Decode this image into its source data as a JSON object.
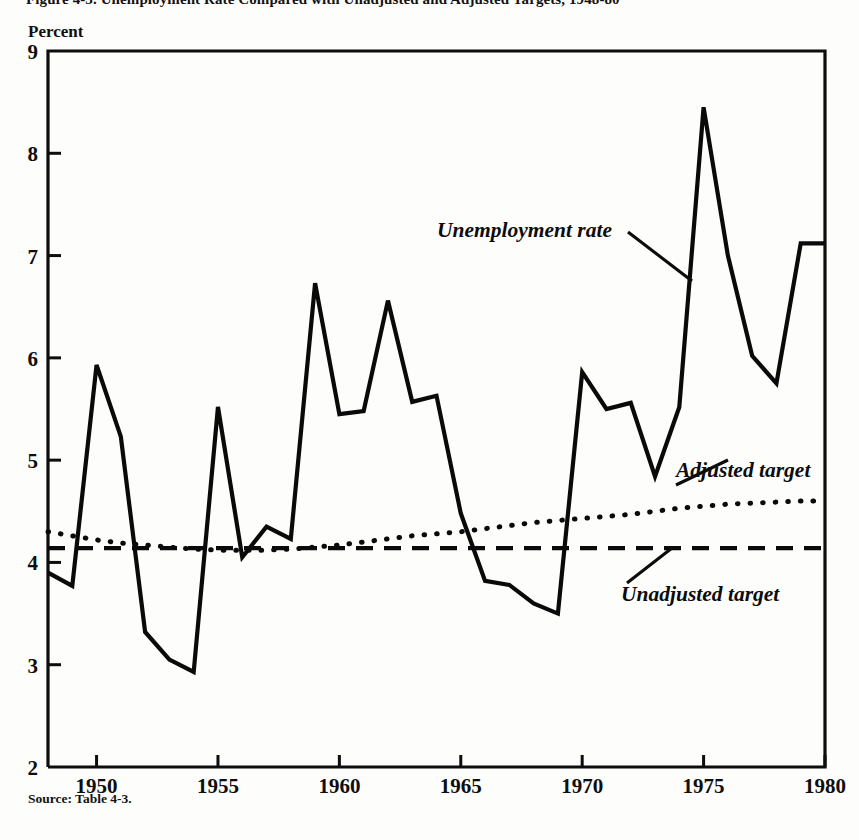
{
  "figure": {
    "clipped_title": "Figure 4-3.  Unemployment Rate Compared with Unadjusted and Adjusted Targets, 1948-80",
    "y_axis_unit": "Percent",
    "source": "Source:  Table 4-3."
  },
  "annotations": {
    "series_label": "Unemployment rate",
    "adjusted_label": "Adjusted target",
    "unadjusted_label": "Unadjusted target"
  },
  "chart_data": {
    "type": "line",
    "title": "Unemployment Rate Compared with Unadjusted and Adjusted Targets, 1948-80",
    "xlabel": "",
    "ylabel": "Percent",
    "xlim": [
      1948,
      1980
    ],
    "ylim": [
      2,
      9
    ],
    "ytick_labels": [
      "9",
      "8",
      "7",
      "6",
      "5",
      "4",
      "3",
      "2"
    ],
    "yticks": [
      9,
      8,
      7,
      6,
      5,
      4,
      3,
      2
    ],
    "xtick_labels": [
      "1950",
      "1955",
      "1960",
      "1965",
      "1970",
      "1975",
      "1980"
    ],
    "xticks": [
      1950,
      1955,
      1960,
      1965,
      1970,
      1975,
      1980
    ],
    "grid": false,
    "legend_position": "inline-annotations",
    "x": [
      1948,
      1949,
      1950,
      1951,
      1952,
      1953,
      1954,
      1955,
      1956,
      1957,
      1958,
      1959,
      1960,
      1961,
      1962,
      1963,
      1964,
      1965,
      1966,
      1967,
      1968,
      1969,
      1970,
      1971,
      1972,
      1973,
      1974,
      1975,
      1976,
      1977,
      1978,
      1979,
      1980
    ],
    "series": [
      {
        "name": "Unemployment rate",
        "style": "solid",
        "color": "#0a0a0a",
        "values": [
          3.9,
          3.77,
          5.93,
          5.23,
          3.32,
          3.05,
          2.93,
          5.52,
          4.05,
          4.35,
          4.23,
          6.73,
          5.45,
          5.48,
          6.56,
          5.57,
          5.63,
          4.48,
          3.82,
          3.78,
          3.6,
          3.5,
          5.86,
          5.5,
          5.56,
          4.84,
          5.52,
          8.45,
          7.0,
          6.02,
          5.75,
          7.12,
          7.12
        ]
      },
      {
        "name": "Adjusted target",
        "style": "dotted",
        "color": "#0a0a0a",
        "values": [
          4.3,
          4.26,
          4.22,
          4.19,
          4.17,
          4.15,
          4.13,
          4.12,
          4.12,
          4.12,
          4.13,
          4.15,
          4.17,
          4.2,
          4.23,
          4.26,
          4.28,
          4.3,
          4.33,
          4.36,
          4.39,
          4.41,
          4.43,
          4.45,
          4.47,
          4.5,
          4.53,
          4.55,
          4.57,
          4.58,
          4.59,
          4.6,
          4.6
        ]
      },
      {
        "name": "Unadjusted target",
        "style": "dashed",
        "color": "#0a0a0a",
        "values": [
          4.14,
          4.14,
          4.14,
          4.14,
          4.14,
          4.14,
          4.14,
          4.14,
          4.14,
          4.14,
          4.14,
          4.14,
          4.14,
          4.14,
          4.14,
          4.14,
          4.14,
          4.14,
          4.14,
          4.14,
          4.14,
          4.14,
          4.14,
          4.14,
          4.14,
          4.14,
          4.14,
          4.14,
          4.14,
          4.14,
          4.14,
          4.14,
          4.14
        ]
      }
    ]
  },
  "plot_geometry": {
    "left": 48,
    "right": 825,
    "top": 51,
    "bottom": 767
  }
}
